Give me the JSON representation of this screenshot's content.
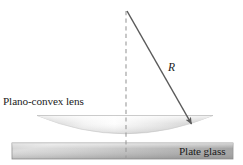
{
  "figure": {
    "background_color": "#ffffff",
    "width": 243,
    "height": 165
  },
  "labels": {
    "lens": "Plano-convex lens",
    "plate": "Plate glass",
    "radius": "R"
  },
  "colors": {
    "text": "#1b1b1b",
    "arrow": "#5a5a5a",
    "dashed_axis": "#9b9b9b",
    "lens_light": "#ffffff",
    "lens_mid": "#e3e3e3",
    "lens_dark": "#b4b4b4",
    "plate_light": "#d8d8d8",
    "plate_dark": "#9a9a9a",
    "plate_border": "#8e8e8e"
  },
  "geometry": {
    "axis": {
      "x": 126,
      "y_top": 11,
      "y_bottom": 159,
      "style": "dashed"
    },
    "radius_arrow": {
      "x1": 127,
      "y1": 11,
      "x2": 193,
      "y2": 126,
      "arrowhead": "end"
    },
    "lens": {
      "left_tip_x": 37,
      "right_tip_x": 213,
      "top_y": 115,
      "bottom_y": 143
    },
    "plate": {
      "x": 12,
      "y": 143,
      "width": 221,
      "height": 16
    }
  }
}
